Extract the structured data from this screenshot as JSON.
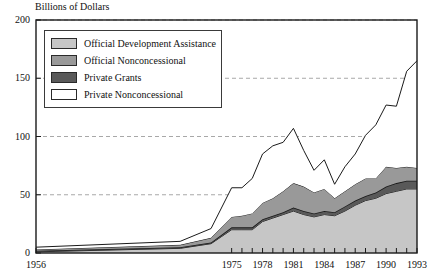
{
  "chart_data": {
    "type": "area",
    "title": "Billions of Dollars",
    "xlabel": "",
    "ylabel": "Billions of Dollars",
    "stacked": true,
    "grid": true,
    "grid_axis": "y",
    "legend_position": "top-left",
    "xlim": [
      1956,
      1993
    ],
    "ylim": [
      0,
      200
    ],
    "yticks": [
      0,
      50,
      100,
      150,
      200
    ],
    "xticks": [
      1956,
      1975,
      1978,
      1981,
      1984,
      1987,
      1990,
      1993
    ],
    "xtick_labels": [
      "1956",
      "1975",
      "1978",
      "1981",
      "1984",
      "1987",
      "1990",
      "1993"
    ],
    "ytick_labels": [
      "0",
      "50",
      "100",
      "150",
      "200"
    ],
    "x": [
      1956,
      1970,
      1973,
      1975,
      1976,
      1977,
      1978,
      1979,
      1980,
      1981,
      1982,
      1983,
      1984,
      1985,
      1986,
      1987,
      1988,
      1989,
      1990,
      1991,
      1992,
      1993
    ],
    "series": [
      {
        "name": "Official Development Assistance",
        "color": "#c6c6c6",
        "values": [
          1,
          4,
          8,
          20,
          20,
          20,
          27,
          30,
          33,
          36,
          33,
          31,
          33,
          32,
          36,
          41,
          45,
          47,
          51,
          53,
          55,
          55
        ]
      },
      {
        "name": "Private Grants",
        "color": "#595959",
        "values": [
          1,
          1,
          1,
          2,
          2,
          2,
          2,
          2,
          2,
          3,
          3,
          3,
          3,
          3,
          4,
          4,
          4,
          5,
          6,
          7,
          7,
          7
        ]
      },
      {
        "name": "Official Nonconcessional",
        "color": "#999999",
        "values": [
          1,
          2,
          4,
          9,
          10,
          12,
          14,
          15,
          18,
          21,
          21,
          18,
          19,
          12,
          13,
          14,
          15,
          12,
          17,
          13,
          12,
          11
        ]
      },
      {
        "name": "Private Nonconcessional",
        "color": "#ffffff",
        "values": [
          2,
          3,
          8,
          25,
          24,
          30,
          42,
          45,
          42,
          47,
          31,
          19,
          25,
          12,
          21,
          26,
          37,
          46,
          53,
          53,
          82,
          92
        ]
      }
    ],
    "cumulative_totals": [
      5,
      10,
      21,
      56,
      56,
      64,
      85,
      92,
      95,
      107,
      88,
      71,
      80,
      59,
      74,
      85,
      101,
      110,
      127,
      126,
      156,
      165
    ],
    "annotations": []
  },
  "legend": {
    "items": [
      {
        "label": "Official Development Assistance",
        "color": "#c6c6c6"
      },
      {
        "label": "Official Nonconcessional",
        "color": "#999999"
      },
      {
        "label": "Private Grants",
        "color": "#595959"
      },
      {
        "label": "Private Nonconcessional",
        "color": "#ffffff"
      }
    ]
  }
}
